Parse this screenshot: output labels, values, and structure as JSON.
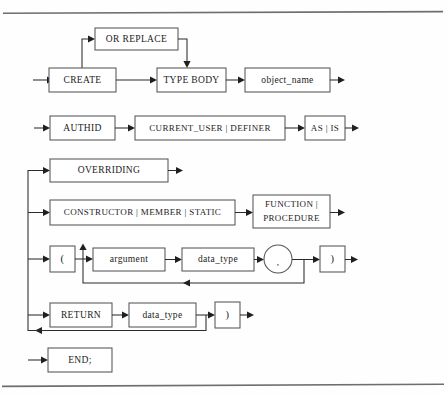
{
  "page": {
    "background_color": "#fefefe",
    "rule_color": "#6e6e6e",
    "box_stroke_color": "#555555",
    "connector_color": "#2b2b2b",
    "text_color": "#1b1b1b",
    "width": 447,
    "height": 394
  },
  "rules": {
    "top_label": "top-horizontal-rule",
    "bottom_label": "bottom-horizontal-rule"
  },
  "diagram": {
    "type": "railroad-syntax-diagram",
    "rows": [
      {
        "id": "row-or-replace",
        "nodes": [
          {
            "id": "or-replace",
            "label": "OR REPLACE",
            "shape": "rect",
            "x": 95,
            "y": 28,
            "w": 83,
            "h": 22
          }
        ]
      },
      {
        "id": "row-create",
        "nodes": [
          {
            "id": "create",
            "label": "CREATE",
            "shape": "rect",
            "x": 49,
            "y": 68,
            "w": 67,
            "h": 24
          },
          {
            "id": "type-body",
            "label": "TYPE BODY",
            "shape": "rect",
            "x": 157,
            "y": 68,
            "w": 69,
            "h": 24
          },
          {
            "id": "object-name",
            "label": "object_name",
            "shape": "rect",
            "x": 245,
            "y": 68,
            "w": 85,
            "h": 24
          }
        ]
      },
      {
        "id": "row-authid",
        "nodes": [
          {
            "id": "authid",
            "label": "AUTHID",
            "shape": "rect",
            "x": 50,
            "y": 116,
            "w": 65,
            "h": 24
          },
          {
            "id": "current-user-definer",
            "label": "CURRENT_USER | DEFINER",
            "shape": "rect",
            "x": 135,
            "y": 116,
            "w": 150,
            "h": 24
          },
          {
            "id": "as-is",
            "label": "AS | IS",
            "shape": "rect",
            "x": 305,
            "y": 116,
            "w": 40,
            "h": 24
          }
        ]
      },
      {
        "id": "row-overriding",
        "nodes": [
          {
            "id": "overriding",
            "label": "OVERRIDING",
            "shape": "rect",
            "x": 50,
            "y": 159,
            "w": 118,
            "h": 23
          }
        ]
      },
      {
        "id": "row-constructor",
        "nodes": [
          {
            "id": "constructor-member-static",
            "label": "CONSTRUCTOR | MEMBER | STATIC",
            "shape": "rect",
            "x": 50,
            "y": 200,
            "w": 185,
            "h": 25
          },
          {
            "id": "function-procedure",
            "label_line1": "FUNCTION |",
            "label_line2": "PROCEDURE",
            "shape": "rect",
            "x": 253,
            "y": 195,
            "w": 77,
            "h": 33
          }
        ]
      },
      {
        "id": "row-arguments",
        "nodes": [
          {
            "id": "open-paren",
            "label": "(",
            "shape": "rect",
            "x": 50,
            "y": 246,
            "w": 25,
            "h": 26
          },
          {
            "id": "argument",
            "label": "argument",
            "shape": "rect",
            "x": 93,
            "y": 248,
            "w": 72,
            "h": 23
          },
          {
            "id": "data-type-arg",
            "label": "data_type",
            "shape": "rect",
            "x": 182,
            "y": 248,
            "w": 72,
            "h": 23
          },
          {
            "id": "comma-separator",
            "label": ",",
            "shape": "circle",
            "cx": 278,
            "cy": 259,
            "r": 14
          },
          {
            "id": "close-paren-arg",
            "label": ")",
            "shape": "rect",
            "x": 320,
            "y": 246,
            "w": 25,
            "h": 26
          }
        ]
      },
      {
        "id": "row-return",
        "nodes": [
          {
            "id": "return",
            "label": "RETURN",
            "shape": "rect",
            "x": 50,
            "y": 303,
            "w": 62,
            "h": 24
          },
          {
            "id": "data-type-return",
            "label": "data_type",
            "shape": "rect",
            "x": 129,
            "y": 303,
            "w": 67,
            "h": 24
          },
          {
            "id": "close-paren-return",
            "label": ")",
            "shape": "rect",
            "x": 215,
            "y": 302,
            "w": 25,
            "h": 26
          }
        ]
      },
      {
        "id": "row-end",
        "nodes": [
          {
            "id": "end-statement",
            "label": "END;",
            "shape": "rect",
            "x": 48,
            "y": 348,
            "w": 64,
            "h": 24
          }
        ]
      }
    ]
  }
}
